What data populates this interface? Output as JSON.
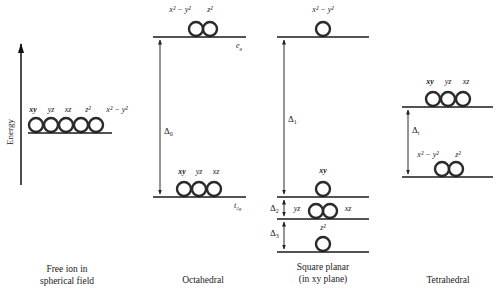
{
  "axis": {
    "label": "Energy"
  },
  "free_ion": {
    "caption_line1": "Free ion in",
    "caption_line2": "spherical field",
    "orbitals": [
      "xy",
      "yz",
      "xz",
      "z²",
      "x² − y²"
    ]
  },
  "octahedral": {
    "caption": "Octahedral",
    "upper": {
      "symbol": "eg",
      "symbol_main": "e",
      "symbol_sub": "g",
      "orbitals": [
        "x² − y²",
        "z²"
      ]
    },
    "lower": {
      "symbol": "t2g",
      "symbol_main": "t",
      "symbol_sub": "2g",
      "orbitals": [
        "xy",
        "yz",
        "xz"
      ]
    },
    "splitting": {
      "label": "Δ",
      "sub": "0"
    }
  },
  "square_planar": {
    "caption_line1": "Square planar",
    "caption_line2": "(in xy plane)",
    "levels": [
      {
        "orbitals": [
          "x² − y²"
        ]
      },
      {
        "orbitals": [
          "xy"
        ]
      },
      {
        "orbitals": [
          "yz",
          "xz"
        ]
      },
      {
        "orbitals": [
          "z²"
        ]
      }
    ],
    "splittings": [
      {
        "label": "Δ",
        "sub": "1"
      },
      {
        "label": "Δ",
        "sub": "2"
      },
      {
        "label": "Δ",
        "sub": "3"
      }
    ]
  },
  "tetrahedral": {
    "caption": "Tetrahedral",
    "upper": {
      "orbitals": [
        "xy",
        "yz",
        "xz"
      ]
    },
    "lower": {
      "orbitals": [
        "x² − y²",
        "z²"
      ]
    },
    "splitting": {
      "label": "Δ",
      "sub": "t"
    }
  }
}
